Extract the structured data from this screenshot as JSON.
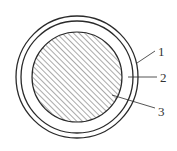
{
  "diagram": {
    "type": "concentric-circle cross-section",
    "colors": {
      "stroke": "#2a2a2a",
      "hatch": "#555555",
      "background": "#ffffff",
      "text": "#333333"
    },
    "geometry": {
      "center": [
        77,
        77
      ],
      "outer_ring_radius": 61,
      "inner_ring_radius": 56,
      "core_radius": 45
    },
    "labels": [
      {
        "id": "1",
        "text": "1",
        "x": 158,
        "y": 56,
        "target": "outer-ring"
      },
      {
        "id": "2",
        "text": "2",
        "x": 160,
        "y": 82,
        "target": "gap-layer"
      },
      {
        "id": "3",
        "text": "3",
        "x": 158,
        "y": 116,
        "target": "hatched-core"
      }
    ]
  }
}
